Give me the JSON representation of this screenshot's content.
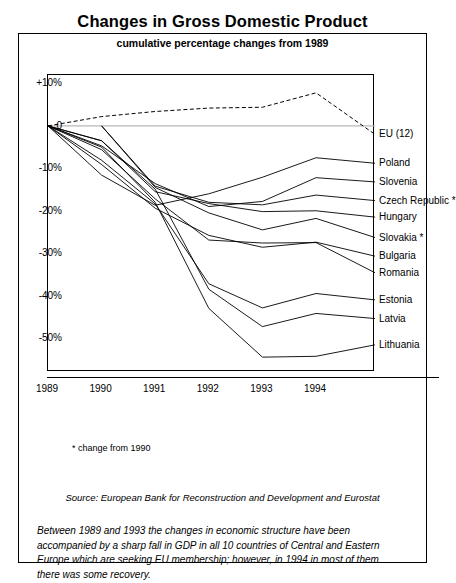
{
  "chart_data": {
    "type": "line",
    "title": "Changes in Gross Domestic Product",
    "subtitle": "cumulative percentage changes from 1989",
    "xlabel": "",
    "ylabel": "",
    "x": [
      1989,
      1990,
      1991,
      1992,
      1993,
      1994
    ],
    "xticklabels": [
      "1989",
      "1990",
      "1991",
      "1992",
      "1993",
      "1994"
    ],
    "yticks": [
      10,
      0,
      -10,
      -20,
      -30,
      -40,
      -50
    ],
    "yticklabels": [
      "+10%",
      "0",
      "-10%",
      "-20%",
      "-30%",
      "-40%",
      "-50%"
    ],
    "ylim": [
      -58,
      12
    ],
    "xlim": [
      1989,
      1995.1
    ],
    "grid": false,
    "legend_position": "right-inline-labels",
    "footnote": "* change from 1990",
    "source": "Source: European Bank for Reconstruction and Development and Eurostat",
    "caption": "Between 1989 and 1993 the changes in economic structure have been accompanied by a sharp fall in GDP in all 10 countries of Central and Eastern Europe which are seeking EU membership; however, in 1994 in most of them there was some recovery.",
    "series": [
      {
        "name": "EU (12)",
        "style": "dashed",
        "label_y": -2,
        "values": [
          0,
          2.2,
          3.4,
          4.2,
          4.4,
          7.8
        ]
      },
      {
        "name": "Poland",
        "style": "solid",
        "label_y": -8.8,
        "values": [
          0,
          -11.6,
          -18.7,
          -16.0,
          -12.1,
          -7.5
        ]
      },
      {
        "name": "Slovenia",
        "style": "solid",
        "label_y": -13.2,
        "values": [
          0,
          -4.7,
          -13.6,
          -19.0,
          -17.8,
          -12.2
        ]
      },
      {
        "name": "Czech Republic *",
        "style": "solid",
        "label_y": -17.6,
        "values": [
          null,
          0,
          -14.2,
          -18.0,
          -18.6,
          -16.3
        ]
      },
      {
        "name": "Hungary",
        "style": "solid",
        "label_y": -21.5,
        "values": [
          0,
          -3.5,
          -15.5,
          -18.3,
          -20.2,
          -20.0
        ]
      },
      {
        "name": "Slovakia *",
        "style": "solid",
        "label_y": -26.3,
        "values": [
          null,
          0,
          -14.5,
          -20.5,
          -24.5,
          -21.8
        ]
      },
      {
        "name": "Bulgaria",
        "style": "solid",
        "label_y": -30.7,
        "values": [
          0,
          -9.1,
          -19.4,
          -25.8,
          -28.6,
          -27.4
        ]
      },
      {
        "name": "Romania",
        "style": "solid",
        "label_y": -34.6,
        "values": [
          0,
          -5.6,
          -17.2,
          -26.9,
          -27.6,
          -27.5
        ]
      },
      {
        "name": "Estonia",
        "style": "solid",
        "label_y": -41.0,
        "values": [
          0,
          -8.1,
          -18.4,
          -37.2,
          -42.9,
          -39.5
        ]
      },
      {
        "name": "Latvia",
        "style": "solid",
        "label_y": -45.4,
        "values": [
          0,
          -3.5,
          -14.9,
          -38.5,
          -47.3,
          -44.2
        ]
      },
      {
        "name": "Lithuania",
        "style": "solid",
        "label_y": -51.6,
        "values": [
          0,
          -5.0,
          -18.0,
          -43.0,
          -54.5,
          -54.3
        ]
      }
    ]
  }
}
